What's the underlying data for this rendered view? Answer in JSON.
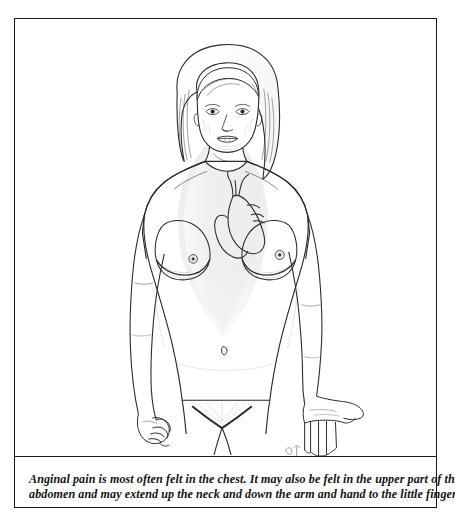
{
  "plate": {
    "title": "Angina pain referral areas",
    "border_color": "#1a1a1a",
    "background_color": "#ffffff"
  },
  "illustration": {
    "name": "female-torso-angina-pain-diagram",
    "subject": "female figure, anterior view, head to upper thigh",
    "style": "pen-and-ink line drawing",
    "line_color": "#2b2b2b",
    "shading_color": "#eeeeee",
    "shading_color_mid": "#e6e6e6",
    "skin_fill": "#ffffff",
    "parts": [
      {
        "name": "head",
        "label": "head with shoulder-length wavy hair"
      },
      {
        "name": "face",
        "label": "face with eyes, nose and lips"
      },
      {
        "name": "neck",
        "label": "neck"
      },
      {
        "name": "shaded-pain-region",
        "label": "shaded chest wedge indicating angina pain area"
      },
      {
        "name": "heart",
        "label": "anatomical heart outline with great vessels"
      },
      {
        "name": "left-breast",
        "label": "left breast"
      },
      {
        "name": "right-breast",
        "label": "right breast"
      },
      {
        "name": "navel",
        "label": "navel"
      },
      {
        "name": "left-arm",
        "label": "left arm hanging at side"
      },
      {
        "name": "right-arm",
        "label": "right arm hanging at side"
      },
      {
        "name": "left-hand",
        "label": "left hand relaxed, fingers curled"
      },
      {
        "name": "right-hand",
        "label": "right hand open with fingers spread"
      },
      {
        "name": "pubic-area",
        "label": "pubic area"
      },
      {
        "name": "legs",
        "label": "upper thighs, cropped"
      },
      {
        "name": "artist-signature",
        "label": "artist signature mark"
      }
    ]
  },
  "caption": {
    "line1": "Anginal pain is most often felt in the chest. It may also be felt in the upper part of the",
    "line2": "abdomen and may extend up the neck and down the arm and hand to the little finger.",
    "full_text": "Anginal pain is most often felt in the chest. It may also be felt in the upper part of the abdomen and may extend up the neck and down the arm and hand to the little finger."
  }
}
